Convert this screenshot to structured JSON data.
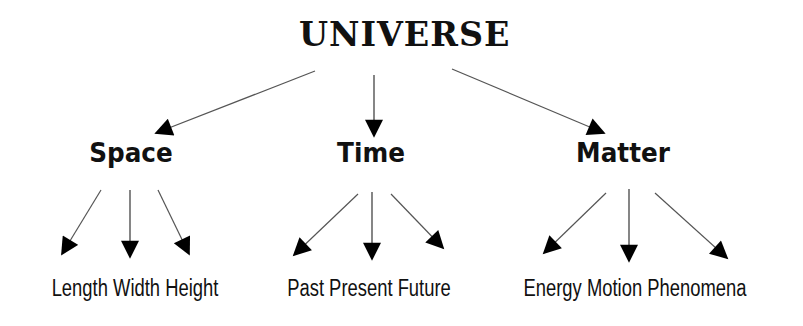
{
  "diagram": {
    "type": "tree",
    "root": {
      "label": "UNIVERSE"
    },
    "categories": [
      {
        "label": "Space",
        "children_text": "Length Width Height",
        "children": [
          "Length",
          "Width",
          "Height"
        ]
      },
      {
        "label": "Time",
        "children_text": "Past Present Future",
        "children": [
          "Past",
          "Present",
          "Future"
        ]
      },
      {
        "label": "Matter",
        "children_text": "Energy Motion Phenomena",
        "children": [
          "Energy",
          "Motion",
          "Phenomena"
        ]
      }
    ],
    "colors": {
      "background": "#ffffff",
      "text": "#111111",
      "arrow_line": "#555555",
      "arrow_head": "#000000"
    }
  }
}
